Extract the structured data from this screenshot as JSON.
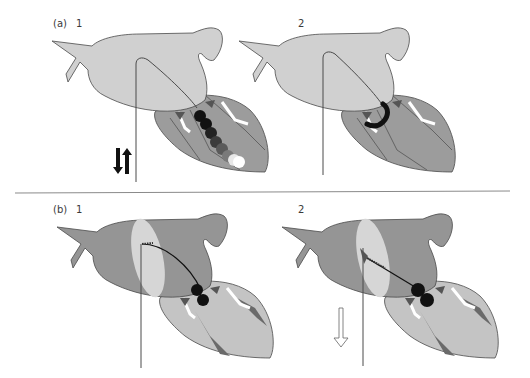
{
  "figure": {
    "panels": [
      {
        "id": "a",
        "label": "(a)",
        "steps": [
          "1",
          "2"
        ]
      },
      {
        "id": "b",
        "label": "(b)",
        "steps": [
          "1",
          "2"
        ]
      }
    ],
    "arrows": {
      "a1": "up-down-arrows-solid",
      "b2": "down-arrow-hollow"
    }
  },
  "colors": {
    "body_light": "#d0d0d0",
    "body_dark": "#959595",
    "lip_mid": "#9c9c9c",
    "lip_light": "#c4c4c4",
    "lip_dark_band": "#6a6a6a",
    "highlight_ellipse": "#d6d6d6",
    "outline": "#4a4a4a",
    "black": "#111111",
    "separator": "#8a8a8a"
  }
}
